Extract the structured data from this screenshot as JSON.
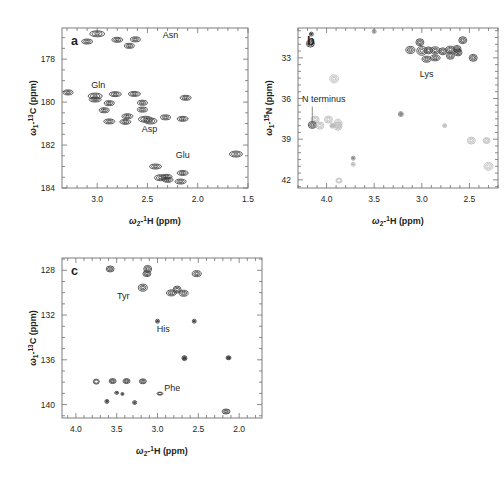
{
  "figure": {
    "background": "#ffffff",
    "ink": "#231f20",
    "axis_color": "#6f6f6f",
    "caption": ""
  },
  "panels": [
    {
      "id": "a",
      "letter": "a",
      "x_axis": {
        "title_prefix": "ω",
        "title_sub": "2",
        "title_sup": "1",
        "title_nucleus": "H",
        "title_units": "(ppm)",
        "label": "ω₂-¹H (ppm)",
        "min": 1.5,
        "max": 3.35,
        "reversed": true,
        "ticks_major": [
          3.0,
          2.5,
          2.0,
          1.5
        ],
        "tick_labels": [
          "3.0",
          "2.5",
          "2.0",
          "1.5"
        ],
        "minor_step": 0.1
      },
      "y_axis": {
        "title_prefix": "ω",
        "title_sub": "1",
        "title_sup": "13",
        "title_nucleus": "C",
        "title_units": "(ppm)",
        "label": "ω₁-¹³C (ppm)",
        "min": 176.55,
        "max": 184.0,
        "reversed": true,
        "ticks_major": [
          178,
          180,
          182,
          184
        ],
        "tick_labels": [
          "178",
          "180",
          "182",
          "184"
        ],
        "minor_step": 0.5
      },
      "annotations": [
        {
          "text": "Asn",
          "x": 2.27,
          "y": 177.02
        },
        {
          "text": "Gln",
          "x": 2.99,
          "y": 179.35
        },
        {
          "text": "Asp",
          "x": 2.48,
          "y": 181.37
        },
        {
          "text": "Glu",
          "x": 2.15,
          "y": 182.58
        }
      ]
    },
    {
      "id": "b",
      "letter": "b",
      "x_axis": {
        "title_prefix": "ω",
        "title_sub": "2",
        "title_sup": "1",
        "title_nucleus": "H",
        "title_units": "(ppm)",
        "label": "ω₂-¹H (ppm)",
        "min": 2.2,
        "max": 4.3,
        "reversed": true,
        "ticks_major": [
          4.0,
          3.5,
          3.0,
          2.5
        ],
        "tick_labels": [
          "4.0",
          "3.5",
          "3.0",
          "2.5"
        ],
        "minor_step": 0.1
      },
      "y_axis": {
        "title_prefix": "ω",
        "title_sub": "1",
        "title_sup": "15",
        "title_nucleus": "N",
        "title_units": "(ppm)",
        "label": "ω₁-¹⁵N (ppm)",
        "min": 30.8,
        "max": 42.6,
        "reversed": true,
        "ticks_major": [
          33,
          36,
          39,
          42
        ],
        "tick_labels": [
          "33",
          "36",
          "39",
          "42"
        ],
        "minor_step": 0.5
      },
      "annotations": [
        {
          "text": "Lys",
          "x": 2.95,
          "y": 34.45
        },
        {
          "text": "N terminus",
          "x": 4.03,
          "y": 36.25
        }
      ],
      "leader": {
        "from_x": 4.15,
        "from_y": 36.6,
        "to_x": 4.15,
        "to_y": 37.9
      }
    },
    {
      "id": "c",
      "letter": "c",
      "x_axis": {
        "title_prefix": "ω",
        "title_sub": "2",
        "title_sup": "1",
        "title_nucleus": "H",
        "title_units": "(ppm)",
        "label": "ω₂-¹H (ppm)",
        "min": 1.72,
        "max": 4.17,
        "reversed": true,
        "ticks_major": [
          4.0,
          3.5,
          3.0,
          2.5,
          2.0
        ],
        "tick_labels": [
          "4.0",
          "3.5",
          "3.0",
          "2.5",
          "2.0"
        ],
        "minor_step": 0.1
      },
      "y_axis": {
        "title_prefix": "ω",
        "title_sub": "1",
        "title_sup": "13",
        "title_nucleus": "C",
        "title_units": "(ppm)",
        "label": "ω₁-¹³C (ppm)",
        "min": 126.9,
        "max": 141.2,
        "reversed": true,
        "ticks_major": [
          128,
          132,
          136,
          140
        ],
        "tick_labels": [
          "128",
          "132",
          "136",
          "140"
        ],
        "minor_step": 1
      },
      "annotations": [
        {
          "text": "Tyr",
          "x": 3.42,
          "y": 130.55
        },
        {
          "text": "His",
          "x": 2.93,
          "y": 133.55
        },
        {
          "text": "Phe",
          "x": 2.82,
          "y": 138.75
        }
      ]
    }
  ],
  "chart_data": [
    {
      "type": "scatter",
      "panel": "a",
      "title": "a",
      "xlabel": "ω₂-¹H (ppm)",
      "ylabel": "ω₁-¹³C (ppm)",
      "xlim": [
        3.35,
        1.5
      ],
      "ylim": [
        184.0,
        176.55
      ],
      "grid": false,
      "legend": "none",
      "marker_shape": "ellipse-contour",
      "annotations": [
        "Asn",
        "Gln",
        "Asp",
        "Glu"
      ],
      "points": [
        {
          "x": 3.0,
          "y": 176.82,
          "w": 15,
          "h": 6
        },
        {
          "x": 3.1,
          "y": 177.18,
          "w": 11,
          "h": 5
        },
        {
          "x": 2.8,
          "y": 177.1,
          "w": 11,
          "h": 5
        },
        {
          "x": 2.62,
          "y": 177.08,
          "w": 10,
          "h": 5
        },
        {
          "x": 2.68,
          "y": 177.38,
          "w": 10,
          "h": 5
        },
        {
          "x": 3.29,
          "y": 179.55,
          "w": 10,
          "h": 5
        },
        {
          "x": 3.02,
          "y": 179.72,
          "w": 14,
          "h": 6
        },
        {
          "x": 3.02,
          "y": 179.88,
          "w": 12,
          "h": 5
        },
        {
          "x": 2.82,
          "y": 179.63,
          "w": 12,
          "h": 5
        },
        {
          "x": 2.63,
          "y": 179.62,
          "w": 12,
          "h": 5
        },
        {
          "x": 2.88,
          "y": 180.05,
          "w": 10,
          "h": 5
        },
        {
          "x": 2.55,
          "y": 180.03,
          "w": 10,
          "h": 5
        },
        {
          "x": 2.12,
          "y": 179.8,
          "w": 11,
          "h": 5
        },
        {
          "x": 2.93,
          "y": 180.38,
          "w": 10,
          "h": 5
        },
        {
          "x": 2.55,
          "y": 180.35,
          "w": 10,
          "h": 5
        },
        {
          "x": 2.7,
          "y": 180.66,
          "w": 11,
          "h": 5
        },
        {
          "x": 2.52,
          "y": 180.8,
          "w": 14,
          "h": 6
        },
        {
          "x": 2.47,
          "y": 180.88,
          "w": 13,
          "h": 6
        },
        {
          "x": 2.32,
          "y": 180.71,
          "w": 10,
          "h": 5
        },
        {
          "x": 2.15,
          "y": 180.78,
          "w": 11,
          "h": 5
        },
        {
          "x": 2.88,
          "y": 180.9,
          "w": 11,
          "h": 5
        },
        {
          "x": 2.72,
          "y": 180.92,
          "w": 11,
          "h": 5
        },
        {
          "x": 1.62,
          "y": 182.42,
          "w": 13,
          "h": 6
        },
        {
          "x": 2.42,
          "y": 183.0,
          "w": 12,
          "h": 5
        },
        {
          "x": 2.37,
          "y": 183.52,
          "w": 12,
          "h": 6
        },
        {
          "x": 2.31,
          "y": 183.48,
          "w": 11,
          "h": 5
        },
        {
          "x": 2.3,
          "y": 183.62,
          "w": 11,
          "h": 5
        },
        {
          "x": 2.15,
          "y": 183.3,
          "w": 11,
          "h": 5
        },
        {
          "x": 2.17,
          "y": 183.7,
          "w": 11,
          "h": 5
        }
      ]
    },
    {
      "type": "scatter",
      "panel": "b",
      "title": "b",
      "xlabel": "ω₂-¹H (ppm)",
      "ylabel": "ω₁-¹⁵N (ppm)",
      "xlim": [
        4.3,
        2.2
      ],
      "ylim": [
        42.6,
        30.8
      ],
      "grid": false,
      "legend": "none",
      "marker_shape": "ring-contour",
      "annotations": [
        "Lys",
        "N terminus"
      ],
      "points": [
        {
          "x": 4.16,
          "y": 31.25,
          "w": 4,
          "h": 4,
          "shade": "dark"
        },
        {
          "x": 3.5,
          "y": 31.05,
          "w": 4,
          "h": 4,
          "shade": "mid"
        },
        {
          "x": 4.17,
          "y": 31.95,
          "w": 8,
          "h": 7,
          "shade": "dark"
        },
        {
          "x": 3.02,
          "y": 31.85,
          "w": 8,
          "h": 7,
          "shade": "dark"
        },
        {
          "x": 2.57,
          "y": 31.7,
          "w": 8,
          "h": 7,
          "shade": "dark"
        },
        {
          "x": 3.12,
          "y": 32.42,
          "w": 9,
          "h": 7,
          "shade": "dark"
        },
        {
          "x": 3.0,
          "y": 32.48,
          "w": 10,
          "h": 9,
          "shade": "dark"
        },
        {
          "x": 2.93,
          "y": 32.45,
          "w": 8,
          "h": 7,
          "shade": "dark"
        },
        {
          "x": 2.86,
          "y": 32.45,
          "w": 9,
          "h": 7,
          "shade": "dark"
        },
        {
          "x": 2.78,
          "y": 32.52,
          "w": 8,
          "h": 7,
          "shade": "dark"
        },
        {
          "x": 2.7,
          "y": 32.4,
          "w": 9,
          "h": 7,
          "shade": "dark"
        },
        {
          "x": 2.63,
          "y": 32.35,
          "w": 8,
          "h": 7,
          "shade": "dark"
        },
        {
          "x": 2.62,
          "y": 32.6,
          "w": 8,
          "h": 7,
          "shade": "dark"
        },
        {
          "x": 2.7,
          "y": 32.85,
          "w": 8,
          "h": 7,
          "shade": "dark"
        },
        {
          "x": 2.86,
          "y": 33.0,
          "w": 10,
          "h": 6,
          "shade": "dark"
        },
        {
          "x": 2.46,
          "y": 33.0,
          "w": 8,
          "h": 7,
          "shade": "dark"
        },
        {
          "x": 2.95,
          "y": 33.1,
          "w": 9,
          "h": 6,
          "shade": "dark"
        },
        {
          "x": 3.92,
          "y": 34.55,
          "w": 9,
          "h": 8,
          "shade": "light"
        },
        {
          "x": 4.12,
          "y": 37.55,
          "w": 8,
          "h": 7,
          "shade": "light"
        },
        {
          "x": 3.98,
          "y": 37.55,
          "w": 8,
          "h": 7,
          "shade": "light"
        },
        {
          "x": 4.15,
          "y": 37.95,
          "w": 8,
          "h": 7,
          "shade": "dark"
        },
        {
          "x": 4.07,
          "y": 38.0,
          "w": 8,
          "h": 7,
          "shade": "light"
        },
        {
          "x": 3.94,
          "y": 38.0,
          "w": 5,
          "h": 5,
          "shade": "light"
        },
        {
          "x": 3.88,
          "y": 37.85,
          "w": 8,
          "h": 9,
          "shade": "light"
        },
        {
          "x": 3.88,
          "y": 38.05,
          "w": 8,
          "h": 8,
          "shade": "light"
        },
        {
          "x": 3.22,
          "y": 37.15,
          "w": 5,
          "h": 5,
          "shade": "mid"
        },
        {
          "x": 2.76,
          "y": 38.0,
          "w": 4,
          "h": 4,
          "shade": "light"
        },
        {
          "x": 2.48,
          "y": 39.1,
          "w": 8,
          "h": 7,
          "shade": "light"
        },
        {
          "x": 2.32,
          "y": 39.1,
          "w": 7,
          "h": 6,
          "shade": "light"
        },
        {
          "x": 2.3,
          "y": 41.0,
          "w": 9,
          "h": 8,
          "shade": "light"
        },
        {
          "x": 3.72,
          "y": 40.4,
          "w": 4,
          "h": 4,
          "shade": "mid"
        },
        {
          "x": 3.72,
          "y": 40.85,
          "w": 4,
          "h": 4,
          "shade": "light"
        },
        {
          "x": 3.87,
          "y": 42.05,
          "w": 6,
          "h": 5,
          "shade": "light"
        }
      ]
    },
    {
      "type": "scatter",
      "panel": "c",
      "title": "c",
      "xlabel": "ω₂-¹H (ppm)",
      "ylabel": "ω₁-¹³C (ppm)",
      "xlim": [
        4.17,
        1.72
      ],
      "ylim": [
        141.2,
        126.9
      ],
      "grid": false,
      "legend": "none",
      "marker_shape": "ellipse-contour",
      "annotations": [
        "Tyr",
        "His",
        "Phe"
      ],
      "points": [
        {
          "x": 3.58,
          "y": 127.88,
          "w": 8,
          "h": 6
        },
        {
          "x": 3.12,
          "y": 127.88,
          "w": 8,
          "h": 7
        },
        {
          "x": 3.13,
          "y": 128.3,
          "w": 8,
          "h": 6
        },
        {
          "x": 2.52,
          "y": 128.3,
          "w": 9,
          "h": 6
        },
        {
          "x": 3.18,
          "y": 129.55,
          "w": 9,
          "h": 7
        },
        {
          "x": 2.76,
          "y": 129.72,
          "w": 8,
          "h": 7
        },
        {
          "x": 2.83,
          "y": 130.02,
          "w": 10,
          "h": 6
        },
        {
          "x": 2.68,
          "y": 130.05,
          "w": 9,
          "h": 6
        },
        {
          "x": 3.0,
          "y": 132.55,
          "w": 4,
          "h": 4
        },
        {
          "x": 2.55,
          "y": 132.55,
          "w": 4,
          "h": 4
        },
        {
          "x": 2.67,
          "y": 135.85,
          "w": 5,
          "h": 5
        },
        {
          "x": 2.13,
          "y": 135.82,
          "w": 5,
          "h": 4
        },
        {
          "x": 3.75,
          "y": 137.95,
          "w": 6,
          "h": 5
        },
        {
          "x": 3.55,
          "y": 137.9,
          "w": 7,
          "h": 5
        },
        {
          "x": 3.38,
          "y": 137.9,
          "w": 7,
          "h": 5
        },
        {
          "x": 3.18,
          "y": 137.92,
          "w": 7,
          "h": 5
        },
        {
          "x": 2.97,
          "y": 139.02,
          "w": 6,
          "h": 3
        },
        {
          "x": 3.5,
          "y": 138.95,
          "w": 4,
          "h": 3
        },
        {
          "x": 3.43,
          "y": 139.05,
          "w": 3,
          "h": 3
        },
        {
          "x": 3.62,
          "y": 139.72,
          "w": 4,
          "h": 4
        },
        {
          "x": 3.28,
          "y": 139.82,
          "w": 4,
          "h": 4
        },
        {
          "x": 2.16,
          "y": 140.62,
          "w": 8,
          "h": 5
        }
      ]
    }
  ]
}
